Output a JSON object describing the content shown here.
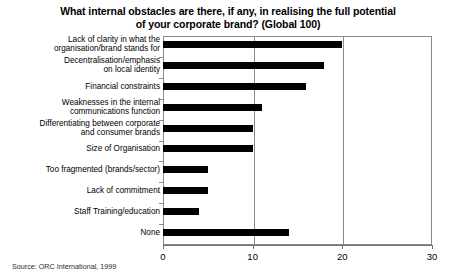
{
  "chart_data": {
    "type": "bar",
    "orientation": "horizontal",
    "title": "What internal obstacles are there, if any, in realising the full potential of your corporate brand? (Global 100)",
    "title_lines": [
      "What internal obstacles are there, if any, in realising the full potential",
      "of your corporate brand? (Global 100)"
    ],
    "xlabel": "",
    "ylabel": "",
    "xlim": [
      0,
      30
    ],
    "grid": true,
    "grid_axis": "x",
    "legend": false,
    "bar_color": "#000000",
    "axis_color": "#8a8a8a",
    "background": "#ffffff",
    "xticks": [
      "0",
      "10",
      "20",
      "30"
    ],
    "xtick_values": [
      0,
      10,
      20,
      30
    ],
    "categories": [
      "Lack of clarity in what the organisation/brand stands for",
      "Decentralisation/emphasis on local identity",
      "Financial constraints",
      "Weaknesses in the internal communications function",
      "Differentiating between corporate and consumer brands",
      "Size of Organisation",
      "Too fragmented (brands/sector)",
      "Lack of commitment",
      "Staff Training/education",
      "None"
    ],
    "category_lines": [
      [
        "Lack of clarity in what the",
        "organisation/brand stands for"
      ],
      [
        "Decentralisation/emphasis",
        "on local identity"
      ],
      [
        "Financial constraints"
      ],
      [
        "Weaknesses in the internal",
        "communications function"
      ],
      [
        "Differentiating between corporate",
        "and consumer brands"
      ],
      [
        "Size of Organisation"
      ],
      [
        "Too fragmented (brands/sector)"
      ],
      [
        "Lack of commitment"
      ],
      [
        "Staff Training/education"
      ],
      [
        "None"
      ]
    ],
    "values": [
      20,
      18,
      16,
      11,
      10,
      10,
      5,
      5,
      4,
      14
    ]
  },
  "source": {
    "note": "Source: ORC International, 1999"
  }
}
